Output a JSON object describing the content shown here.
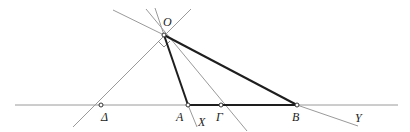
{
  "figure": {
    "labels": {
      "O": "O",
      "Delta": "Δ",
      "A": "A",
      "Gamma": "Γ",
      "B": "B",
      "X": "X",
      "Y": "Y"
    },
    "points": [
      {
        "id": "O",
        "x": 164,
        "y": 35
      },
      {
        "id": "Delta",
        "x": 101,
        "y": 105
      },
      {
        "id": "A",
        "x": 188,
        "y": 105
      },
      {
        "id": "Gamma",
        "x": 221,
        "y": 105
      },
      {
        "id": "B",
        "x": 297,
        "y": 105
      }
    ],
    "colors": {
      "thin_line": "#9a9a9a",
      "thick_line": "#1e1e1e",
      "label": "#222222"
    }
  }
}
